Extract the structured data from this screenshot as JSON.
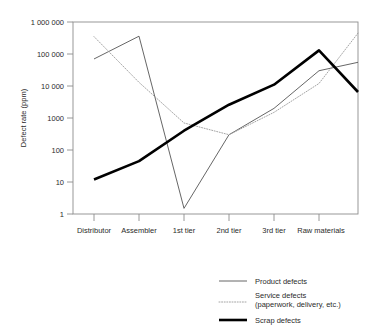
{
  "chart_data": {
    "type": "line",
    "title": "",
    "xlabel": "",
    "ylabel": "Defect rate (ppm)",
    "yscale": "log",
    "ylim": [
      1,
      1000000
    ],
    "ytick_labels": [
      "1 000 000",
      "100 000",
      "10 000",
      "1000",
      "100",
      "10",
      "1"
    ],
    "ytick_values": [
      1000000,
      100000,
      10000,
      1000,
      100,
      10,
      1
    ],
    "categories": [
      "Distributor",
      "Assembler",
      "1st tier",
      "2nd tier",
      "3rd tier",
      "Raw materials"
    ],
    "grid": false,
    "legend_position": "below",
    "series": [
      {
        "name": "Product defects",
        "style": "thin-solid",
        "color": "#555555",
        "values": [
          70000,
          360000,
          1.5,
          300,
          2000,
          30000
        ],
        "extends_past_last_tick_to": 55000
      },
      {
        "name": "Service defects (paperwork, delivery, etc.)",
        "style": "dotted",
        "color": "#8a8a8a",
        "values": [
          350000,
          13000,
          700,
          300,
          1500,
          12000
        ],
        "extends_past_last_tick_to": 450000
      },
      {
        "name": "Scrap defects",
        "style": "thick-solid",
        "color": "#000000",
        "values": [
          12,
          45,
          400,
          2600,
          11000,
          130000
        ],
        "extends_past_last_tick_to": 6500
      }
    ]
  },
  "legend": {
    "items": [
      {
        "label": "Product defects",
        "label2": ""
      },
      {
        "label": "Service defects",
        "label2": "(paperwork, delivery, etc.)"
      },
      {
        "label": "Scrap defects",
        "label2": ""
      }
    ]
  }
}
